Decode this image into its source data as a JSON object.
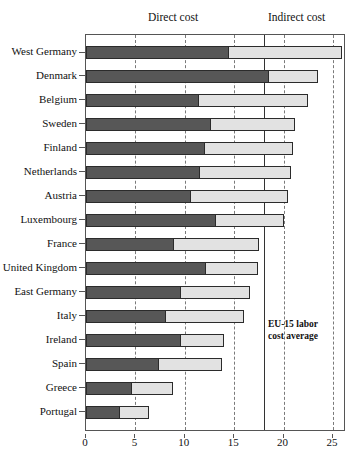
{
  "chart_data": {
    "type": "bar",
    "orientation": "horizontal",
    "stacked": true,
    "title": "",
    "xlabel": "",
    "ylabel": "",
    "xlim": [
      0,
      25
    ],
    "xticks": [
      0,
      5,
      10,
      15,
      20,
      25
    ],
    "xtick_labels": [
      "0",
      "5",
      "10",
      "15",
      "20",
      "25"
    ],
    "grid": true,
    "grid_style": "dashed-vertical",
    "legend_position": "top",
    "categories": [
      "West Germany",
      "Denmark",
      "Belgium",
      "Sweden",
      "Finland",
      "Netherlands",
      "Austria",
      "Luxembourg",
      "France",
      "United Kingdom",
      "East Germany",
      "Italy",
      "Ireland",
      "Spain",
      "Greece",
      "Portugal"
    ],
    "series": [
      {
        "name": "Direct cost",
        "color": "#575757",
        "values": [
          14.5,
          18.5,
          11.4,
          12.7,
          12.0,
          11.5,
          10.6,
          13.2,
          8.9,
          12.1,
          9.6,
          8.1,
          9.6,
          7.4,
          4.7,
          3.4
        ]
      },
      {
        "name": "Indirect cost",
        "color": "#e2e2e2",
        "values": [
          11.4,
          5.0,
          11.1,
          8.5,
          9.0,
          9.2,
          9.8,
          6.8,
          8.6,
          5.3,
          7.0,
          7.9,
          4.4,
          6.4,
          4.1,
          3.0
        ]
      }
    ],
    "totals": [
      25.9,
      23.5,
      22.5,
      21.2,
      21.0,
      20.7,
      20.4,
      20.0,
      17.5,
      17.4,
      16.6,
      16.0,
      14.0,
      13.8,
      8.8,
      6.4
    ],
    "annotations": [
      {
        "name": "eu15-average-line",
        "text_line1": "EU-15 labor",
        "text_line2": "cost average",
        "value": 18.0
      }
    ]
  },
  "headers": {
    "direct": "Direct cost",
    "indirect": "Indirect cost"
  },
  "annotation": {
    "line1": "EU-15 labor",
    "line2": "cost average"
  },
  "colors": {
    "direct": "#575757",
    "indirect": "#e2e2e2",
    "axis": "#555555",
    "grid": "#7a7a7a",
    "avg_line": "#333333"
  }
}
